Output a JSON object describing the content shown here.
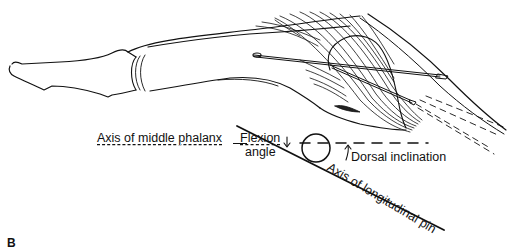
{
  "figure": {
    "panel_letter": "B",
    "labels": {
      "axis_middle_phalanx": "Axis of middle phalanx",
      "flexion_angle_line1": "Flexion",
      "flexion_angle_line2": "angle",
      "dorsal_inclination": "Dorsal inclination",
      "axis_longitudinal_pin": "Axis of longitudinal pin"
    },
    "colors": {
      "line": "#111111",
      "background": "#ffffff"
    }
  }
}
